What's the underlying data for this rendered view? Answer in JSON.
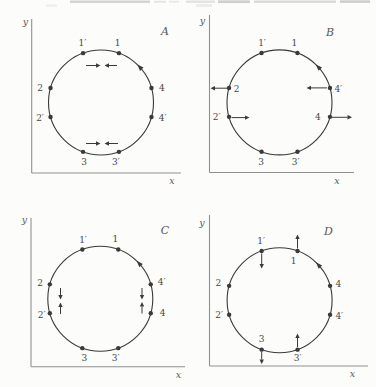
{
  "figure": {
    "background": "#fcfcfb",
    "ink": "#3a3a3a",
    "axis_color": "#8f8f8f",
    "text_color": "#474747",
    "artifacts": [
      {
        "x": 70,
        "y": 0.5,
        "w": 80,
        "h": 2.4,
        "o": 0.38
      },
      {
        "x": 154,
        "y": 0.8,
        "w": 12,
        "h": 2.0,
        "o": 0.2
      },
      {
        "x": 169,
        "y": 0.8,
        "w": 10,
        "h": 2.0,
        "o": 0.16
      },
      {
        "x": 186,
        "y": 0.5,
        "w": 29,
        "h": 2.4,
        "o": 0.22
      },
      {
        "x": 218,
        "y": 0.3,
        "w": 32,
        "h": 2.8,
        "o": 0.4
      },
      {
        "x": 254,
        "y": 0.5,
        "w": 82,
        "h": 2.4,
        "o": 0.32
      },
      {
        "x": 340,
        "y": 0.3,
        "w": 30,
        "h": 2.6,
        "o": 0.42
      },
      {
        "x": 46,
        "y": 4.5,
        "w": 11,
        "h": 2.2,
        "o": 0.12
      },
      {
        "x": 196,
        "y": 4.0,
        "w": 16,
        "h": 3.0,
        "o": 0.14
      }
    ],
    "panels": [
      {
        "letter": "A",
        "letter_pos": [
          165,
          31
        ],
        "rotation": "counterclockwise",
        "rotation_marker_angle": 43,
        "axis": {
          "x_label": "x",
          "y_label": "y",
          "origin": [
            31.7,
            173
          ],
          "y_top": 19,
          "x_end": 181,
          "x_label_pos": [
            172,
            180.5
          ],
          "y_label_pos": [
            25.5,
            21
          ]
        },
        "circle": {
          "cx": 101,
          "cy": 102.5,
          "r": 52.5
        },
        "points": [
          {
            "label": "1",
            "angle": 70,
            "dx": -1.3,
            "dy": -9.9
          },
          {
            "label": "1′",
            "angle": 110,
            "dx": -0.7,
            "dy": -9.9
          },
          {
            "label": "2",
            "angle": 164,
            "dx": -10.5,
            "dy": 0
          },
          {
            "label": "2′",
            "angle": 196,
            "dx": -10.5,
            "dy": 1
          },
          {
            "label": "3",
            "angle": 250,
            "dx": 1,
            "dy": 9.7
          },
          {
            "label": "3′",
            "angle": 290,
            "dx": -3,
            "dy": 10.2
          },
          {
            "label": "4",
            "angle": 16,
            "dx": 10.5,
            "dy": 0.3
          },
          {
            "label": "4′",
            "angle": 344,
            "dx": 11.2,
            "dy": 1.3
          }
        ],
        "arrows": [
          [
            86,
            65.5,
            100.5,
            65.5
          ],
          [
            117,
            65.5,
            104.5,
            65.5
          ],
          [
            86,
            143.5,
            100.5,
            143.5
          ],
          [
            118,
            143.5,
            104.5,
            143.5
          ]
        ]
      },
      {
        "letter": "B",
        "letter_pos": [
          330,
          32
        ],
        "rotation": "counterclockwise",
        "rotation_marker_angle": 43,
        "axis": {
          "x_label": "x",
          "y_label": "y",
          "origin": [
            209.5,
            172.5
          ],
          "y_top": 15,
          "x_end": 354,
          "x_label_pos": [
            337,
            180
          ],
          "y_label_pos": [
            202.5,
            20.5
          ]
        },
        "circle": {
          "cx": 279.5,
          "cy": 102.4,
          "r": 52.5
        },
        "points": [
          {
            "label": "1",
            "angle": 70,
            "dx": -3.2,
            "dy": -9.8
          },
          {
            "label": "1′",
            "angle": 110,
            "dx": 0.5,
            "dy": -9.8
          },
          {
            "label": "2",
            "angle": 164,
            "dx": 7.7,
            "dy": 1.1
          },
          {
            "label": "2′",
            "angle": 196,
            "dx": -12.3,
            "dy": -0.2
          },
          {
            "label": "3",
            "angle": 250,
            "dx": -0.5,
            "dy": 10.3
          },
          {
            "label": "3′",
            "angle": 290,
            "dx": -1.8,
            "dy": 10.3
          },
          {
            "label": "4′",
            "angle": 16,
            "dx": 8.3,
            "dy": 1.1
          },
          {
            "label": "4",
            "angle": 344,
            "dx": -12,
            "dy": 0.4
          }
        ],
        "arrows": [
          [
            228.5,
            88.2,
            210.5,
            88.2
          ],
          [
            231.5,
            117.6,
            249.5,
            117.6
          ],
          [
            327,
            87.9,
            306.5,
            87.9
          ],
          [
            331.5,
            117.3,
            352,
            117.3
          ]
        ]
      },
      {
        "letter": "C",
        "letter_pos": [
          165,
          230.5
        ],
        "rotation": "counterclockwise",
        "rotation_marker_angle": 43,
        "axis": {
          "x_label": "x",
          "y_label": "y",
          "origin": [
            31,
            366.7
          ],
          "y_top": 218,
          "x_end": 185,
          "x_label_pos": [
            178.5,
            374.5
          ],
          "y_label_pos": [
            24.5,
            219.5
          ]
        },
        "circle": {
          "cx": 100.3,
          "cy": 298.8,
          "r": 52.5
        },
        "points": [
          {
            "label": "1",
            "angle": 70,
            "dx": -3,
            "dy": -10.5
          },
          {
            "label": "1′",
            "angle": 110,
            "dx": 0.7,
            "dy": -9.5
          },
          {
            "label": "2",
            "angle": 164,
            "dx": -9.8,
            "dy": -1
          },
          {
            "label": "2′",
            "angle": 196,
            "dx": -8.1,
            "dy": 1.7
          },
          {
            "label": "3",
            "angle": 250,
            "dx": 2,
            "dy": 9.9
          },
          {
            "label": "3′",
            "angle": 290,
            "dx": -2.6,
            "dy": 9.9
          },
          {
            "label": "4′",
            "angle": 16,
            "dx": 10.9,
            "dy": -2.6
          },
          {
            "label": "4",
            "angle": 344,
            "dx": 11.9,
            "dy": -0.6
          }
        ],
        "arrows": [
          [
            60.5,
            288,
            60.5,
            299.5
          ],
          [
            60.5,
            314,
            60.5,
            302.5
          ],
          [
            142,
            288,
            142,
            299.5
          ],
          [
            142,
            313.5,
            142,
            302
          ]
        ]
      },
      {
        "letter": "D",
        "letter_pos": [
          328.3,
          231.5
        ],
        "rotation": "counterclockwise",
        "rotation_marker_angle": 43,
        "axis": {
          "x_label": "x",
          "y_label": "y",
          "origin": [
            209.5,
            366
          ],
          "y_top": 215,
          "x_end": 368,
          "x_label_pos": [
            352.5,
            373.5
          ],
          "y_label_pos": [
            202,
            222.5
          ]
        },
        "circle": {
          "cx": 279.6,
          "cy": 300.3,
          "r": 52.5
        },
        "points": [
          {
            "label": "1",
            "angle": 70,
            "dx": -4,
            "dy": 10.5
          },
          {
            "label": "1′",
            "angle": 110,
            "dx": -0.5,
            "dy": -9.5
          },
          {
            "label": "2",
            "angle": 164,
            "dx": -10.8,
            "dy": -2.5
          },
          {
            "label": "2′",
            "angle": 196,
            "dx": -10,
            "dy": 0.3
          },
          {
            "label": "3",
            "angle": 250,
            "dx": 0,
            "dy": -11
          },
          {
            "label": "3′",
            "angle": 290,
            "dx": 0,
            "dy": 8
          },
          {
            "label": "4",
            "angle": 16,
            "dx": 8.2,
            "dy": -1.8
          },
          {
            "label": "4′",
            "angle": 344,
            "dx": 9.2,
            "dy": 1.3
          }
        ],
        "arrows": [
          [
            297.5,
            248.5,
            297.5,
            234.5
          ],
          [
            261.7,
            253.5,
            261.7,
            268.5
          ],
          [
            261.7,
            352,
            261.7,
            364
          ],
          [
            297.5,
            347,
            297.5,
            333.5
          ]
        ]
      }
    ]
  }
}
